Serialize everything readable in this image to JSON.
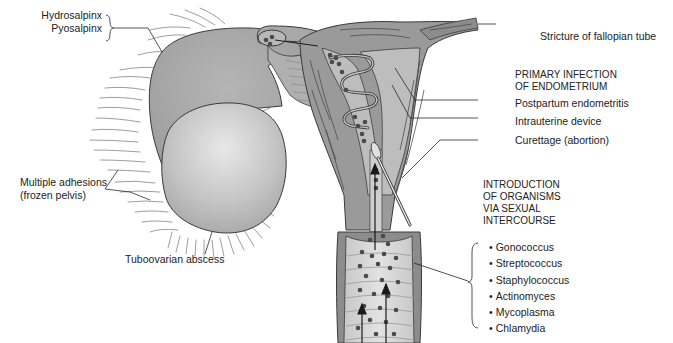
{
  "diagram": {
    "colors": {
      "tissue_dark": "#8a8a8a",
      "tissue_mid": "#a9a9a9",
      "tissue_light": "#c9c9c9",
      "abscess_center": "#e6e6e6",
      "outline": "#3a3a3a",
      "organism_dots": "#4a4a4a",
      "adhesion_strands": "#9a9a9a",
      "background": "#ffffff"
    },
    "labels": {
      "hydrosalpinx": "Hydrosalpinx",
      "pyosalpinx": "Pyosalpinx",
      "multiple_adhesions": "Multiple adhesions",
      "frozen_pelvis": "(frozen pelvis)",
      "tuboovarian_abscess": "Tuboovarian abscess",
      "stricture": "Stricture of fallopian tube",
      "postpartum": "Postpartum endometritis",
      "iud": "Intrauterine device",
      "curettage": "Curettage (abortion)"
    },
    "headings": {
      "primary_infection_line1": "PRIMARY INFECTION",
      "primary_infection_line2": "OF ENDOMETRIUM",
      "introduction_line1": "INTRODUCTION",
      "introduction_line2": "OF ORGANISMS",
      "introduction_line3": "VIA SEXUAL",
      "introduction_line4": "INTERCOURSE"
    },
    "organisms": [
      "Gonococcus",
      "Streptococcus",
      "Staphylococcus",
      "Actinomyces",
      "Mycoplasma",
      "Chlamydia"
    ]
  }
}
